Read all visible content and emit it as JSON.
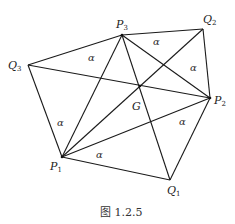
{
  "diagram": {
    "caption": "图 1.2.5",
    "points": {
      "P1": {
        "label": "P",
        "sub": "1",
        "x": 62,
        "y": 157
      },
      "P2": {
        "label": "P",
        "sub": "2",
        "x": 210,
        "y": 98
      },
      "P3": {
        "label": "P",
        "sub": "3",
        "x": 122,
        "y": 35
      },
      "Q1": {
        "label": "Q",
        "sub": "1",
        "x": 170,
        "y": 180
      },
      "Q2": {
        "label": "Q",
        "sub": "2",
        "x": 203,
        "y": 29
      },
      "Q3": {
        "label": "Q",
        "sub": "3",
        "x": 28,
        "y": 65
      },
      "G": {
        "label": "G",
        "x": 140,
        "y": 86
      }
    },
    "angle_label": "α",
    "edges": [
      [
        "P3",
        "Q2"
      ],
      [
        "Q2",
        "P2"
      ],
      [
        "P3",
        "Q3"
      ],
      [
        "Q3",
        "P1"
      ],
      [
        "P1",
        "Q1"
      ],
      [
        "Q1",
        "P2"
      ],
      [
        "P1",
        "P3"
      ],
      [
        "P1",
        "P2"
      ],
      [
        "P2",
        "P3"
      ],
      [
        "Q3",
        "P2"
      ],
      [
        "P1",
        "Q2"
      ],
      [
        "P3",
        "Q1"
      ]
    ],
    "alpha_marks": 6
  }
}
